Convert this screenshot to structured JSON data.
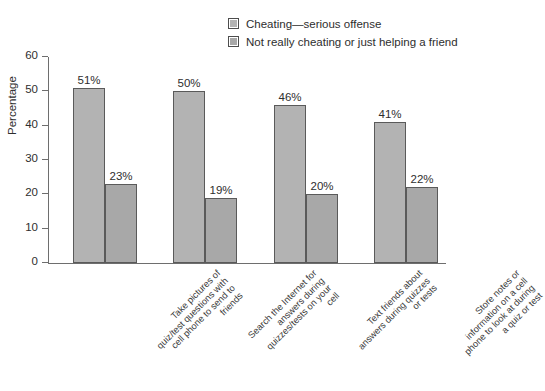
{
  "chart_data": {
    "type": "bar",
    "title": "",
    "xlabel": "",
    "ylabel": "Percentage",
    "ylim": [
      0,
      60
    ],
    "yticks": [
      0,
      10,
      20,
      30,
      40,
      50,
      60
    ],
    "grid": false,
    "legend_position": "top-right",
    "categories": [
      "Take pictures of quiz/test questions with cell phone to send to friends",
      "Search the Internet for answers during quizzes/tests on your cell",
      "Text friends about answers during quizzes or tests",
      "Store notes or information on a cell phone to look at during a quiz or test"
    ],
    "category_lines": [
      [
        "Take pictures of",
        "quiz/test questions with",
        "cell phone to send to",
        "friends"
      ],
      [
        "Search the Internet for",
        "answers during",
        "quizzes/tests on your",
        "cell"
      ],
      [
        "Text friends about",
        "answers during quizzes",
        "or tests"
      ],
      [
        "Store notes or",
        "information on a cell",
        "phone to look at during",
        "a quiz or test"
      ]
    ],
    "series": [
      {
        "name": "Cheating—serious offense",
        "color": "#b3b3b3",
        "values": [
          51,
          50,
          46,
          41
        ],
        "value_labels": [
          "51%",
          "50%",
          "46%",
          "41%"
        ]
      },
      {
        "name": "Not really cheating or just helping a friend",
        "color": "#a8a8a8",
        "values": [
          23,
          19,
          20,
          22
        ],
        "value_labels": [
          "23%",
          "19%",
          "20%",
          "22%"
        ]
      }
    ]
  },
  "axis": {
    "y_tick_labels": [
      "0",
      "10",
      "20",
      "30",
      "40",
      "50",
      "60"
    ],
    "y_title": "Percentage"
  },
  "legend": {
    "items": [
      {
        "label": "Cheating—serious offense",
        "color": "#b3b3b3"
      },
      {
        "label": "Not really cheating or just helping a friend",
        "color": "#a8a8a8"
      }
    ]
  }
}
